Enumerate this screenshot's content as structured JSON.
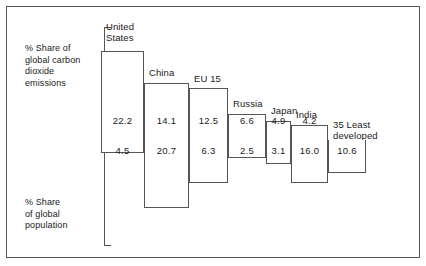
{
  "figure": {
    "left_captions": {
      "emissions": "% Share of\nglobal carbon\ndioxide\nemissions",
      "population": "% Share\nof global\npopulation"
    },
    "border_color": "#555555",
    "background_color": "#ffffff",
    "text_color": "#1a1a1a"
  },
  "chart_data": {
    "type": "bar",
    "title": "",
    "subtitle": "",
    "xlabel": "",
    "ylabel": "",
    "orientation": "vertical-diverging-staircase",
    "grid": false,
    "legend_position": "none",
    "axis_note": "Bars above the centre line show share of global carbon dioxide emissions; bars below show share of global population.",
    "categories": [
      "United States",
      "China",
      "EU 15",
      "Russia",
      "Japan",
      "India",
      "35 Least developed"
    ],
    "category_labels": [
      "United\nStates",
      "China",
      "EU 15",
      "Russia",
      "Japan",
      "India",
      "35 Least\ndeveloped"
    ],
    "series": [
      {
        "name": "% Share of global carbon dioxide emissions",
        "direction": "up",
        "values": [
          22.2,
          14.1,
          12.5,
          6.6,
          4.9,
          4.2,
          0.0
        ],
        "value_labels": [
          "22.2",
          "14.1",
          "12.5",
          "6.6",
          "4.9",
          "4.2",
          ""
        ]
      },
      {
        "name": "% Share of global population",
        "direction": "down",
        "values": [
          4.5,
          20.7,
          6.3,
          2.5,
          3.1,
          16.0,
          10.6
        ],
        "value_labels": [
          "4.5",
          "20.7",
          "6.3",
          "2.5",
          "3.1",
          "16.0",
          "10.6"
        ]
      }
    ],
    "ylim": [
      0,
      23
    ]
  }
}
